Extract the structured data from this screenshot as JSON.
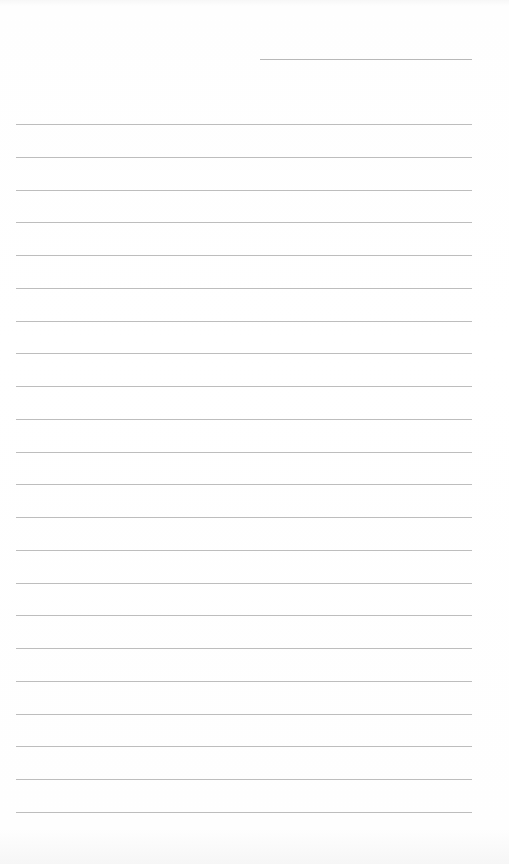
{
  "page": {
    "type": "blank lined notebook page",
    "header_line": {
      "x": 260,
      "y": 59,
      "width": 212
    },
    "ruled_lines": {
      "count": 22,
      "first_y": 124,
      "spacing": 32.76,
      "left": 16,
      "width": 456
    },
    "colors": {
      "paper": "#ffffff",
      "line": "#bdbdbd"
    }
  }
}
